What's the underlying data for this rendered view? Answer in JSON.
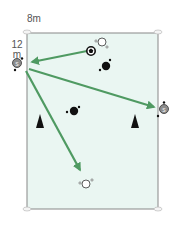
{
  "diagram": {
    "type": "soccer-drill",
    "width_label": "8m",
    "length_label_line1": "12",
    "length_label_line2": "m",
    "colors": {
      "field_fill": "#eaf6f2",
      "field_border": "#888888",
      "arrow": "#4f9a62",
      "player_dark": "#111111",
      "player_grey": "#8d8d8d",
      "cone": "#111111"
    },
    "elements": [
      {
        "kind": "player-grey",
        "label": "S",
        "x": 17,
        "y": 63
      },
      {
        "kind": "player-grey",
        "label": "S",
        "x": 163,
        "y": 109
      },
      {
        "kind": "player-white",
        "x": 102,
        "y": 42
      },
      {
        "kind": "player-white",
        "x": 86,
        "y": 184
      },
      {
        "kind": "player-black",
        "x": 106,
        "y": 66
      },
      {
        "kind": "player-black",
        "x": 74,
        "y": 111
      },
      {
        "kind": "ball",
        "x": 91,
        "y": 51
      },
      {
        "kind": "cone",
        "x": 40,
        "y": 122
      },
      {
        "kind": "cone",
        "x": 135,
        "y": 122
      }
    ],
    "arrows": [
      {
        "from": [
          87,
          51
        ],
        "to": [
          31,
          62
        ]
      },
      {
        "from": [
          29,
          69
        ],
        "to": [
          155,
          107
        ]
      },
      {
        "from": [
          26,
          71
        ],
        "to": [
          81,
          172
        ]
      }
    ]
  }
}
